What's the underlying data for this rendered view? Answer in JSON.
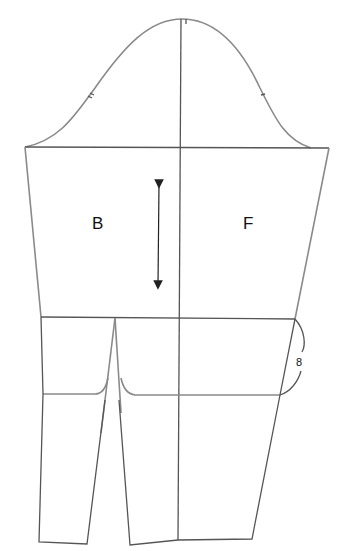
{
  "diagram": {
    "type": "sleeve-pattern",
    "labels": {
      "back": "B",
      "front": "F",
      "measurement": "8"
    },
    "colors": {
      "outline": "#8a8a8a",
      "construction": "#555555",
      "text": "#111111",
      "background": "#ffffff"
    },
    "marks": {
      "back_notches": 2,
      "front_notches": 1,
      "top_notch": 1,
      "grainline": "double-headed vertical arrow"
    }
  }
}
